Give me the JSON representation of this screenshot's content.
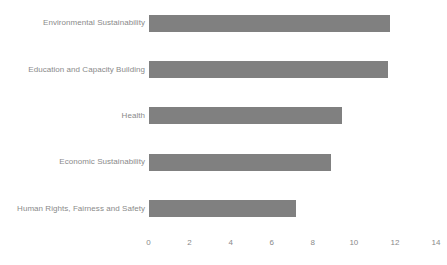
{
  "chart_data": {
    "type": "bar",
    "orientation": "horizontal",
    "title": "",
    "subtitle": "",
    "xlabel": "",
    "ylabel": "",
    "categories": [
      "Environmental Sustainability",
      "Education and Capacity Building",
      "Health",
      "Economic Sustainability",
      "Human Rights, Fairness and Safety"
    ],
    "values": [
      11.75,
      11.65,
      9.4,
      8.9,
      7.2
    ],
    "xlim": [
      0,
      14
    ],
    "xticks": [
      0,
      2,
      4,
      6,
      8,
      10,
      12,
      14
    ],
    "xtick_labels": [
      "0",
      "2",
      "4",
      "6",
      "8",
      "10",
      "12",
      "14"
    ],
    "grid": false,
    "legend": false,
    "legend_position": "none",
    "bar_color": "#808080",
    "label_color": "#8a8a8a",
    "background_color": "#ffffff"
  }
}
